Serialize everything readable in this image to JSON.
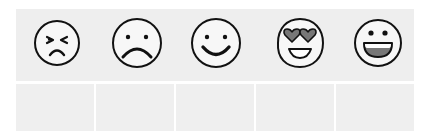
{
  "faces": [
    {
      "glyph": "face-with-squinting-eyes-and-frown"
    },
    {
      "glyph": "face-with-dot-eyes-and-frown"
    },
    {
      "glyph": "face-with-dot-eyes-and-smile"
    },
    {
      "glyph": "face-with-heart-eyes-and-open-smile"
    },
    {
      "glyph": "face-with-dot-eyes-and-open-grin"
    }
  ],
  "boxes": [
    {
      "text": ""
    },
    {
      "text": ""
    },
    {
      "text": ""
    },
    {
      "text": ""
    },
    {
      "text": ""
    }
  ],
  "colors": {
    "panel_bg": "#eeeeee",
    "box_bg": "#efefef",
    "stroke": "#111111",
    "fill_gray": "#777777",
    "face_fill": "#f7f7f7"
  }
}
